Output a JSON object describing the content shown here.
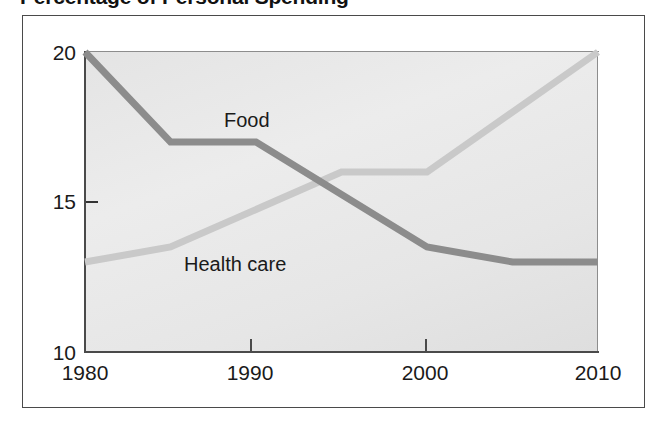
{
  "figure": {
    "title": "Percentage of Personal Spending"
  },
  "axes": {
    "y_ticks": [
      {
        "label": "20",
        "value": 20
      },
      {
        "label": "15",
        "value": 15
      },
      {
        "label": "10",
        "value": 10
      }
    ],
    "x_ticks": [
      {
        "label": "1980",
        "value": 1980
      },
      {
        "label": "1990",
        "value": 1990
      },
      {
        "label": "2000",
        "value": 2000
      },
      {
        "label": "2010",
        "value": 2010
      }
    ]
  },
  "series_labels": {
    "food": "Food",
    "health_care": "Health care"
  },
  "colors": {
    "food_line": "#8c8c8c",
    "health_care_line": "#c9c9c9",
    "plot_background": "#e8e8e8",
    "axis": "#4a4a4a",
    "text": "#1a1a1a",
    "frame_border": "#4a4a4a"
  },
  "chart_data": {
    "type": "line",
    "title": "Percentage of Personal Spending",
    "xlabel": "",
    "ylabel": "",
    "xlim": [
      1980,
      2010
    ],
    "ylim": [
      10,
      20
    ],
    "xticks": [
      1980,
      1990,
      2000,
      2010
    ],
    "yticks": [
      10,
      15,
      20
    ],
    "grid": false,
    "legend": "inline-labels",
    "units": "percent of personal spending",
    "series": [
      {
        "name": "Food",
        "color": "#8c8c8c",
        "label_position": "inline-above-line",
        "x": [
          1980,
          1985,
          1990,
          2000,
          2005,
          2010
        ],
        "values": [
          20,
          17,
          17,
          13.5,
          13,
          13
        ]
      },
      {
        "name": "Health care",
        "color": "#c9c9c9",
        "label_position": "inline-below-line",
        "x": [
          1980,
          1985,
          1995,
          2000,
          2010
        ],
        "values": [
          13,
          13.5,
          16,
          16,
          20
        ]
      }
    ],
    "annotations": [
      {
        "text": "Food and Health care lines cross",
        "x": 1993.5,
        "y": 15.7
      }
    ]
  }
}
